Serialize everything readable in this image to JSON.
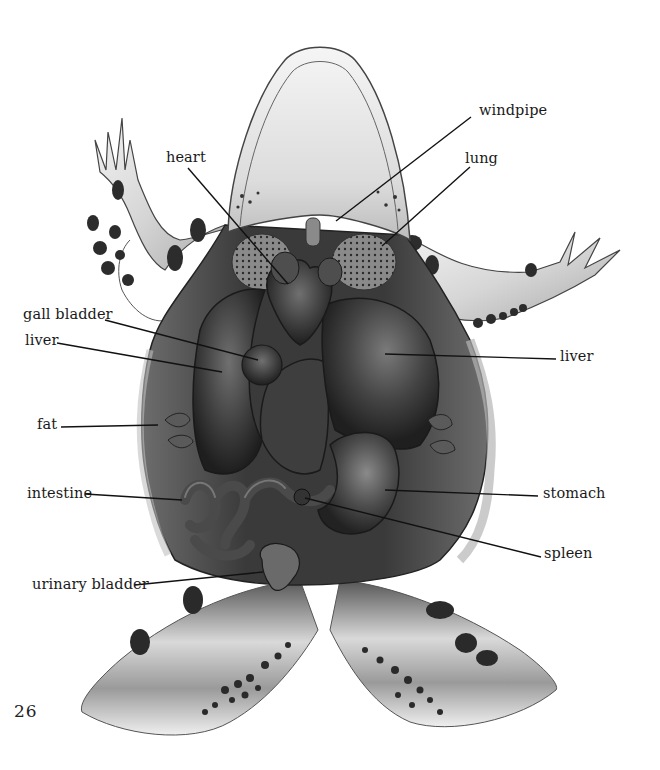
{
  "figure": {
    "page_number": "26",
    "labels": [
      {
        "id": "heart",
        "text": "heart",
        "x": 166,
        "y": 150,
        "line": [
          188,
          168,
          288,
          284
        ]
      },
      {
        "id": "windpipe",
        "text": "windpipe",
        "x": 479,
        "y": 103,
        "line": [
          471,
          117,
          336,
          221
        ]
      },
      {
        "id": "lung",
        "text": "lung",
        "x": 465,
        "y": 151,
        "line": [
          470,
          167,
          382,
          246
        ]
      },
      {
        "id": "gall-bladder",
        "text": "gall bladder",
        "x": 23,
        "y": 307,
        "line": [
          105,
          320,
          258,
          360
        ]
      },
      {
        "id": "liver-left",
        "text": "liver",
        "x": 25,
        "y": 333,
        "line": [
          57,
          343,
          222,
          372
        ]
      },
      {
        "id": "liver-right",
        "text": "liver",
        "x": 560,
        "y": 349,
        "line": [
          556,
          359,
          385,
          354
        ]
      },
      {
        "id": "fat",
        "text": "fat",
        "x": 37,
        "y": 417,
        "line": [
          61,
          427,
          158,
          425
        ]
      },
      {
        "id": "intestine",
        "text": "intestine",
        "x": 27,
        "y": 486,
        "line": [
          85,
          494,
          182,
          500
        ]
      },
      {
        "id": "stomach",
        "text": "stomach",
        "x": 543,
        "y": 486,
        "line": [
          538,
          496,
          385,
          490
        ]
      },
      {
        "id": "spleen",
        "text": "spleen",
        "x": 544,
        "y": 546,
        "line": [
          541,
          557,
          305,
          498
        ]
      },
      {
        "id": "urinary-bladder",
        "text": "urinary bladder",
        "x": 32,
        "y": 577,
        "line": [
          135,
          585,
          263,
          572
        ]
      }
    ]
  },
  "colors": {
    "background": "#ffffff",
    "skin_light": "#e8e8e8",
    "skin_mid": "#bdbdbd",
    "organ_dark": "#2e2e2e",
    "organ_mid": "#4a4a4a",
    "organ_highlight": "#6a6a6a",
    "spots": "#2a2a2a",
    "leader_line": "#111111"
  }
}
